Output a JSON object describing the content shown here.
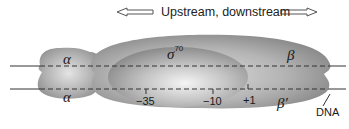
{
  "header": {
    "label": "Upstream, downstream",
    "left_arrow": "arrow-left-icon",
    "right_arrow": "arrow-right-icon"
  },
  "subunits": {
    "alpha_top": "α",
    "alpha_bottom": "α",
    "sigma": "σ",
    "sigma_sup": "70",
    "beta": "β",
    "beta_prime": "β′"
  },
  "positions": {
    "minus35": "−35",
    "minus10": "−10",
    "plus1": "+1"
  },
  "dna_label": "DNA",
  "colors": {
    "protein_dark": "#7a7a7a",
    "protein_mid": "#a8a8a8",
    "protein_light": "#e6e6e6",
    "dna_line": "#333333"
  }
}
